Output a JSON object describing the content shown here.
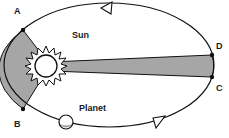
{
  "diagram": {
    "colors": {
      "line": "#111111",
      "shaded_area": "#a6a6a6",
      "background": "#ffffff"
    },
    "labels": {
      "point_a": "A",
      "point_b": "B",
      "point_c": "C",
      "point_d": "D",
      "sun": "Sun",
      "planet": "Planet"
    },
    "elements": {
      "orbit": "elliptical orbit",
      "sun": "Sun at focus",
      "planet": "Planet on orbit",
      "sector_ab": "shaded sector A-Sun-B",
      "sector_dc": "shaded sector D-Sun-C",
      "direction": "counter-clockwise arrows"
    }
  }
}
